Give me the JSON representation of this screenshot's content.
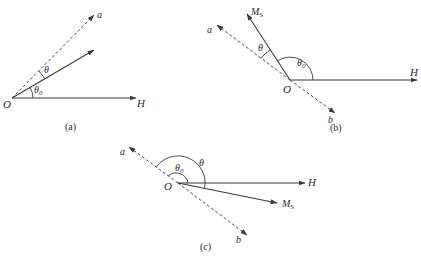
{
  "figure": {
    "panels": [
      {
        "id": "a",
        "caption": "(a)",
        "labels": {
          "origin": "O",
          "field": "H",
          "easy_axis": "a",
          "theta": "θ",
          "theta0": "θ",
          "theta0_sub": "0"
        }
      },
      {
        "id": "b",
        "caption": "(b)",
        "labels": {
          "origin": "O",
          "field": "H",
          "easy_axis_pos": "a",
          "easy_axis_neg": "b",
          "magnetization": "M",
          "magnetization_sub": "S",
          "theta": "θ",
          "theta0": "θ",
          "theta0_sub": "0"
        }
      },
      {
        "id": "c",
        "caption": "(c)",
        "labels": {
          "origin": "O",
          "field": "H",
          "easy_axis_pos": "a",
          "easy_axis_neg": "b",
          "magnetization": "M",
          "magnetization_sub": "S",
          "theta": "θ",
          "theta0": "θ",
          "theta0_sub": "0"
        }
      }
    ],
    "colors": {
      "line": "#3a3a3a",
      "background": "#ffffff"
    }
  }
}
